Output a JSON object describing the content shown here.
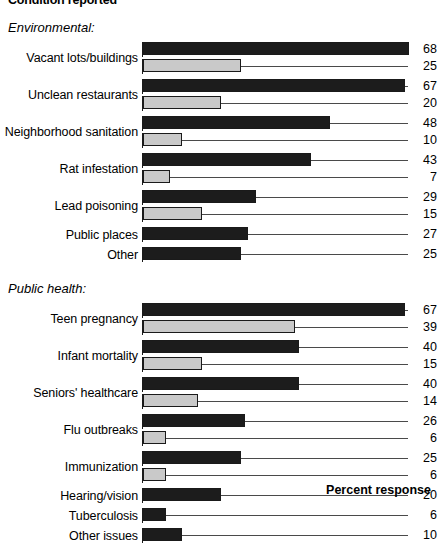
{
  "chart_data": {
    "type": "bar",
    "title": "Condition reported",
    "xlabel": "Percent response",
    "ylabel": "",
    "orientation": "horizontal",
    "grid": false,
    "legend_position": "none",
    "xlim": [
      0,
      70
    ],
    "colors": {
      "series_1": "#1c1c1c",
      "series_2": "#c9c9c9",
      "outline": "#1a1a1a",
      "leader_line": "#4a4a4a"
    },
    "series": [
      {
        "name": "series_1",
        "style": "dark"
      },
      {
        "name": "series_2",
        "style": "light"
      }
    ],
    "sections": [
      {
        "heading": "Environmental:",
        "groups": [
          {
            "category": "Vacant lots/buildings",
            "values": [
              68,
              25
            ]
          },
          {
            "category": "Unclean restaurants",
            "values": [
              67,
              20
            ]
          },
          {
            "category": "Neighborhood sanitation",
            "values": [
              48,
              10
            ]
          },
          {
            "category": "Rat infestation",
            "values": [
              43,
              7
            ]
          },
          {
            "category": "Lead poisoning",
            "values": [
              29,
              15
            ]
          },
          {
            "category": "Public places",
            "values": [
              27
            ]
          },
          {
            "category": "Other",
            "values": [
              25
            ]
          }
        ]
      },
      {
        "heading": "Public health:",
        "groups": [
          {
            "category": "Teen pregnancy",
            "values": [
              67,
              39
            ]
          },
          {
            "category": "Infant mortality",
            "values": [
              40,
              15
            ]
          },
          {
            "category": "Seniors' healthcare",
            "values": [
              40,
              14
            ]
          },
          {
            "category": "Flu outbreaks",
            "values": [
              26,
              6
            ]
          },
          {
            "category": "Immunization",
            "values": [
              25,
              6
            ]
          },
          {
            "category": "Hearing/vision",
            "values": [
              20
            ]
          },
          {
            "category": "Tuberculosis",
            "values": [
              6
            ]
          },
          {
            "category": "Other issues",
            "values": [
              10
            ]
          }
        ]
      }
    ]
  }
}
